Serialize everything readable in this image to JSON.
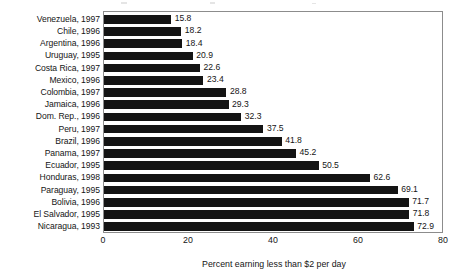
{
  "figure": {
    "axis_title": "Percent earning less than $2 per day",
    "frame_color": "#8c8c8c",
    "bar_color": "#141414"
  },
  "chart_data": {
    "type": "bar",
    "orientation": "horizontal",
    "title": "",
    "subtitle": "",
    "xlabel": "Percent earning less than $2 per day",
    "ylabel": "",
    "xlim": [
      0,
      80
    ],
    "xticks": [
      0,
      20,
      40,
      60,
      80
    ],
    "xtick_labels": [
      "0",
      "20",
      "40",
      "60",
      "80"
    ],
    "grid": false,
    "legend": null,
    "categories": [
      "Venezuela, 1997",
      "Chile, 1996",
      "Argentina, 1996",
      "Uruguay, 1995",
      "Costa Rica, 1997",
      "Mexico, 1996",
      "Colombia, 1997",
      "Jamaica, 1996",
      "Dom. Rep., 1996",
      "Peru, 1997",
      "Brazil, 1996",
      "Panama, 1997",
      "Ecuador, 1995",
      "Honduras, 1998",
      "Paraguay, 1995",
      "Bolivia, 1996",
      "El Salvador, 1995",
      "Nicaragua, 1993"
    ],
    "values": [
      15.8,
      18.2,
      18.4,
      20.9,
      22.6,
      23.4,
      28.8,
      29.3,
      32.3,
      37.5,
      41.8,
      45.2,
      50.5,
      62.6,
      69.1,
      71.7,
      71.8,
      72.9
    ],
    "data_labels": [
      "15.8",
      "18.2",
      "18.4",
      "20.9",
      "22.6",
      "23.4",
      "28.8",
      "29.3",
      "32.3",
      "37.5",
      "41.8",
      "45.2",
      "50.5",
      "62.6",
      "69.1",
      "71.7",
      "71.8",
      "72.9"
    ]
  }
}
